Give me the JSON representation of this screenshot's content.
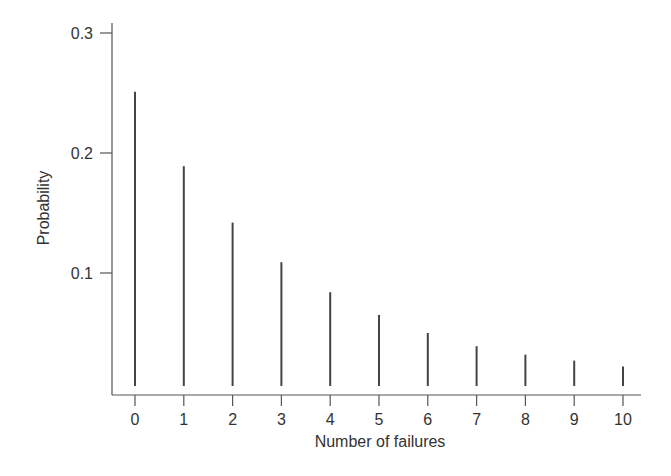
{
  "chart_data": {
    "type": "bar",
    "style": "stem",
    "title": "",
    "xlabel": "Number of failures",
    "ylabel": "Probability",
    "categories": [
      "0",
      "1",
      "2",
      "3",
      "4",
      "5",
      "6",
      "7",
      "8",
      "9",
      "10"
    ],
    "x": [
      0,
      1,
      2,
      3,
      4,
      5,
      6,
      7,
      8,
      9,
      10
    ],
    "values": [
      0.251,
      0.189,
      0.142,
      0.109,
      0.084,
      0.065,
      0.05,
      0.039,
      0.032,
      0.027,
      0.022
    ],
    "xlim": [
      -0.5,
      10.4
    ],
    "ylim": [
      0,
      0.3
    ],
    "yticks": [
      0.1,
      0.2,
      0.3
    ],
    "ytick_labels": [
      "0.1",
      "0.2",
      "0.3"
    ],
    "xticks": [
      0,
      1,
      2,
      3,
      4,
      5,
      6,
      7,
      8,
      9,
      10
    ],
    "xtick_labels": [
      "0",
      "1",
      "2",
      "3",
      "4",
      "5",
      "6",
      "7",
      "8",
      "9",
      "10"
    ],
    "grid": false,
    "legend": null,
    "colors": {
      "stem": "#444444",
      "axis": "#555555",
      "text": "#333333"
    }
  }
}
